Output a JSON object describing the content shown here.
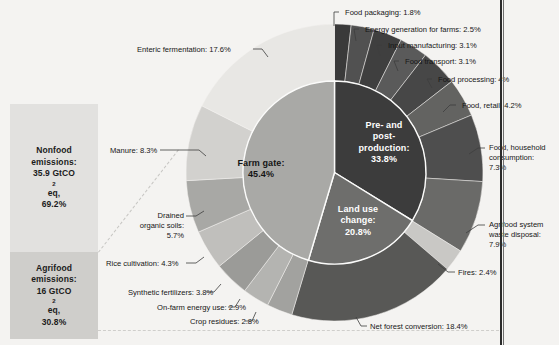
{
  "chart_data": {
    "type": "pie",
    "title": "",
    "layout": "nested donut (inner pie: 3 categories, outer ring: 15 sub-categories) with a stacked bar at left",
    "legend": "none (direct labels)",
    "bar": {
      "type": "stacked-bar",
      "unit": "GtCO2eq",
      "segments": [
        {
          "name": "Nonfood emissions",
          "line1": "Nonfood",
          "line2": "emissions:",
          "value": 35.9,
          "value_text": "35.9 GtCO",
          "value_sub": "2",
          "value_tail": "eq,",
          "percent": 69.2,
          "percent_text": "69.2%",
          "color": "#e2e1df"
        },
        {
          "name": "Agrifood emissions",
          "line1": "Agrifood",
          "line2": "emissions:",
          "value": 16,
          "value_text": "16 GtCO",
          "value_sub": "2",
          "value_tail": "eq,",
          "percent": 30.8,
          "percent_text": "30.8%",
          "color": "#cfcecb"
        }
      ]
    },
    "inner_ring": {
      "name": "Agrifood system emissions by stage",
      "categories": [
        "Farm gate",
        "Pre- and post-production",
        "Land use change"
      ],
      "values": [
        45.4,
        20.8,
        33.8
      ],
      "slices": [
        {
          "label": "Farm gate:",
          "percent_text": "45.4%",
          "percent": 45.4,
          "color": "#a9a9a6",
          "text_color": "dark"
        },
        {
          "label": "Pre- and post-production:",
          "line1": "Pre- and",
          "line2": "post-",
          "line3": "production:",
          "percent_text": "33.8%",
          "percent": 33.8,
          "color": "#3c3c3c",
          "text_color": "light"
        },
        {
          "label": "Land use change:",
          "line1": "Land use",
          "line2": "change:",
          "percent_text": "20.8%",
          "percent": 20.8,
          "color": "#6e6e6c",
          "text_color": "light"
        }
      ]
    },
    "outer_ring": {
      "name": "Agrifood system emissions by source",
      "categories": [
        "Food packaging",
        "Energy generation for farms",
        "Input manufacturing",
        "Food transport",
        "Food processing",
        "Food, retail",
        "Food, household consumption",
        "Agrifood system waste disposal",
        "Fires",
        "Net forest conversion",
        "Crop residues",
        "On-farm energy use",
        "Synthetic fertilizers",
        "Rice cultivation",
        "Drained organic soils",
        "Manure",
        "Enteric fermentation"
      ],
      "values": [
        1.8,
        2.5,
        3.1,
        3.1,
        4,
        4.2,
        7.3,
        7.9,
        2.4,
        18.4,
        2.8,
        2.9,
        3.8,
        4.3,
        5.7,
        8.3,
        17.6
      ],
      "slices": [
        {
          "label": "Food packaging: 1.8%",
          "percent": 1.8,
          "group": "Pre- and post-production"
        },
        {
          "label": "Energy generation for farms: 2.5%",
          "percent": 2.5,
          "group": "Pre- and post-production"
        },
        {
          "label": "Input manufacturing: 3.1%",
          "percent": 3.1,
          "group": "Pre- and post-production"
        },
        {
          "label": "Food transport: 3.1%",
          "percent": 3.1,
          "group": "Pre- and post-production"
        },
        {
          "label": "Food processing: 4%",
          "percent": 4,
          "group": "Pre- and post-production"
        },
        {
          "label": "Food, retail: 4.2%",
          "percent": 4.2,
          "group": "Pre- and post-production"
        },
        {
          "label": "Food, household consumption: 7.3%",
          "l1": "Food, household",
          "l2": "consumption:",
          "l3": "7.3%",
          "percent": 7.3,
          "group": "Pre- and post-production"
        },
        {
          "label": "Agrifood system waste disposal: 7.9%",
          "l1": "Agrifood system",
          "l2": "waste disposal:",
          "l3": "7.9%",
          "percent": 7.9,
          "group": "Pre- and post-production"
        },
        {
          "label": "Fires: 2.4%",
          "percent": 2.4,
          "group": "Land use change"
        },
        {
          "label": "Net forest conversion: 18.4%",
          "percent": 18.4,
          "group": "Land use change"
        },
        {
          "label": "Crop residues: 2.8%",
          "percent": 2.8,
          "group": "Farm gate"
        },
        {
          "label": "On-farm energy use: 2.9%",
          "percent": 2.9,
          "group": "Farm gate"
        },
        {
          "label": "Synthetic fertilizers: 3.8%",
          "percent": 3.8,
          "group": "Farm gate"
        },
        {
          "label": "Rice cultivation: 4.3%",
          "percent": 4.3,
          "group": "Farm gate"
        },
        {
          "label": "Drained organic soils: 5.7%",
          "l1": "Drained",
          "l2": "organic soils:",
          "l3": "5.7%",
          "percent": 5.7,
          "group": "Farm gate"
        },
        {
          "label": "Manure: 8.3%",
          "percent": 8.3,
          "group": "Farm gate"
        },
        {
          "label": "Enteric fermentation: 17.6%",
          "percent": 17.6,
          "group": "Farm gate"
        }
      ]
    },
    "colors": {
      "background": "#f4f3f1",
      "dark_slice": "#3c3c3c",
      "mid_slice": "#6e6e6c",
      "light_slice": "#a9a9a6",
      "bar_nonfood": "#e2e1df",
      "bar_agrifood": "#cfcecb"
    }
  }
}
